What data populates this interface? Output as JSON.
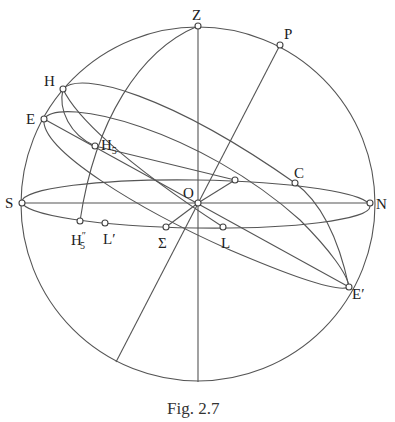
{
  "figure": {
    "caption": "Fig. 2.7",
    "stroke_color": "#555555",
    "background": "#ffffff"
  },
  "labels": {
    "Z": "Z",
    "P": "P",
    "H": "H",
    "E": "E",
    "H5_base": "H",
    "H5_sub": "5",
    "C": "C",
    "S": "S",
    "O": "O",
    "N": "N",
    "H5pp_base": "H",
    "H5pp_sup": "″",
    "H5pp_sub": "5",
    "Lprime": "L′",
    "Sigma": "Σ",
    "L": "L",
    "Eprime": "E′"
  },
  "points": [
    {
      "name": "Z",
      "x": 198,
      "y": 26
    },
    {
      "name": "P",
      "x": 280,
      "y": 45
    },
    {
      "name": "H",
      "x": 63,
      "y": 89
    },
    {
      "name": "E",
      "x": 44,
      "y": 119
    },
    {
      "name": "H5",
      "x": 95,
      "y": 146
    },
    {
      "name": "C",
      "x": 295,
      "y": 183
    },
    {
      "name": "horizon-meridian-point",
      "x": 235,
      "y": 180
    },
    {
      "name": "S",
      "x": 22,
      "y": 203
    },
    {
      "name": "O",
      "x": 198,
      "y": 203
    },
    {
      "name": "N",
      "x": 370,
      "y": 203
    },
    {
      "name": "H5''",
      "x": 80,
      "y": 221
    },
    {
      "name": "L'",
      "x": 105,
      "y": 223
    },
    {
      "name": "Sigma",
      "x": 166,
      "y": 227
    },
    {
      "name": "L",
      "x": 223,
      "y": 227
    },
    {
      "name": "E'",
      "x": 349,
      "y": 287
    }
  ]
}
